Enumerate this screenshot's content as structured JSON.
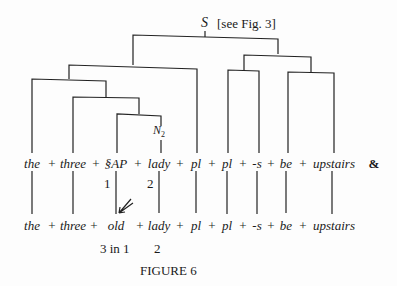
{
  "figure": {
    "root_label": "S",
    "root_note": "[see Fig. 3]",
    "node_label": "N",
    "node_subscript": "2",
    "caption": "FIGURE 6",
    "ampersand": "&",
    "top_row": {
      "words": [
        "the",
        "three",
        "§AP",
        "lady",
        "pl",
        "pl",
        "-s",
        "be",
        "upstairs"
      ],
      "plus": "+",
      "indices": [
        {
          "label": "1"
        },
        {
          "label": "2"
        }
      ]
    },
    "bottom_row": {
      "words": [
        "the",
        "three",
        "old",
        "lady",
        "pl",
        "pl",
        "-s",
        "be",
        "upstairs"
      ],
      "plus": "+",
      "indices": [
        {
          "label": "3 in 1"
        },
        {
          "label": "2"
        }
      ]
    }
  }
}
